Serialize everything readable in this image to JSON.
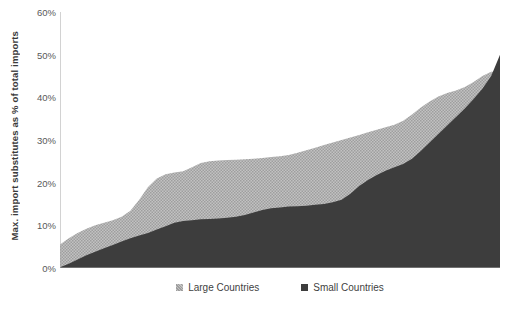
{
  "chart_data": {
    "type": "area",
    "title": "",
    "subtitle": "",
    "xlabel": "",
    "ylabel": "Max. import substitutes as % of total imports",
    "ylim": [
      0,
      60
    ],
    "xlim": [
      0,
      100
    ],
    "grid": false,
    "stacked": false,
    "yticks": [
      "0%",
      "10%",
      "20%",
      "30%",
      "40%",
      "50%",
      "60%"
    ],
    "ytick_values": [
      0,
      10,
      20,
      30,
      40,
      50,
      60
    ],
    "xticks": [],
    "legend_position": "bottom-center",
    "colors": {
      "large_countries": "#b3b3b3",
      "small_countries": "#3d3d3d",
      "axis": "#a6a6a6",
      "text": "#404040",
      "background": "#ffffff"
    },
    "series": [
      {
        "name": "Large Countries",
        "color": "#b3b3b3",
        "x": [
          0,
          2,
          4,
          6,
          8,
          10,
          12,
          14,
          16,
          18,
          20,
          22,
          24,
          26,
          28,
          30,
          32,
          34,
          36,
          38,
          40,
          42,
          44,
          46,
          48,
          50,
          52,
          54,
          56,
          58,
          60,
          62,
          64,
          66,
          68,
          70,
          72,
          74,
          76,
          78,
          80,
          82,
          84,
          86,
          88,
          90,
          92,
          94,
          96,
          98,
          100
        ],
        "values": [
          5.5,
          7.0,
          8.2,
          9.2,
          10.0,
          10.6,
          11.2,
          12.0,
          13.4,
          16.0,
          19.0,
          21.0,
          22.0,
          22.4,
          22.7,
          23.6,
          24.6,
          25.0,
          25.2,
          25.3,
          25.4,
          25.5,
          25.6,
          25.8,
          26.0,
          26.2,
          26.5,
          27.0,
          27.6,
          28.2,
          28.8,
          29.4,
          30.0,
          30.6,
          31.2,
          31.8,
          32.4,
          33.0,
          33.6,
          34.5,
          36.0,
          37.6,
          39.0,
          40.2,
          41.0,
          41.6,
          42.4,
          43.6,
          45.0,
          46.0,
          46.2
        ]
      },
      {
        "name": "Small Countries",
        "color": "#3d3d3d",
        "x": [
          0,
          2,
          4,
          6,
          8,
          10,
          12,
          14,
          16,
          18,
          20,
          22,
          24,
          26,
          28,
          30,
          32,
          34,
          36,
          38,
          40,
          42,
          44,
          46,
          48,
          50,
          52,
          54,
          56,
          58,
          60,
          62,
          64,
          66,
          68,
          70,
          72,
          74,
          76,
          78,
          80,
          82,
          84,
          86,
          88,
          90,
          92,
          94,
          96,
          98,
          100
        ],
        "values": [
          0.2,
          1.0,
          2.0,
          3.0,
          3.8,
          4.6,
          5.4,
          6.2,
          7.0,
          7.6,
          8.2,
          9.0,
          9.8,
          10.6,
          11.0,
          11.2,
          11.4,
          11.5,
          11.6,
          11.8,
          12.0,
          12.4,
          13.0,
          13.6,
          14.0,
          14.2,
          14.4,
          14.5,
          14.6,
          14.8,
          15.0,
          15.4,
          16.0,
          17.4,
          19.2,
          20.6,
          21.8,
          22.8,
          23.6,
          24.4,
          25.6,
          27.4,
          29.4,
          31.4,
          33.4,
          35.4,
          37.4,
          39.6,
          42.0,
          45.0,
          50.0
        ]
      }
    ],
    "legend": [
      {
        "label": "Large Countries",
        "color": "#b3b3b3",
        "marker": "square"
      },
      {
        "label": "Small Countries",
        "color": "#3d3d3d",
        "marker": "square"
      }
    ]
  }
}
